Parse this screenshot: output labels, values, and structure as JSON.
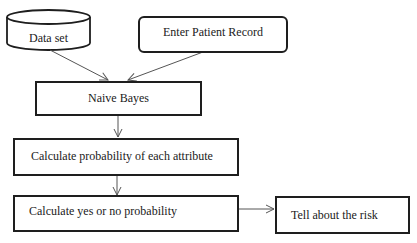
{
  "diagram": {
    "type": "flowchart",
    "nodes": {
      "dataset": {
        "label": "Data set",
        "shape": "cylinder"
      },
      "patient": {
        "label": "Enter Patient Record",
        "shape": "rounded-rect"
      },
      "naive": {
        "label": "Naive Bayes",
        "shape": "rect"
      },
      "attr": {
        "label": "Calculate probability of each attribute",
        "shape": "rect"
      },
      "yesno": {
        "label": "Calculate yes or no probability",
        "shape": "rect"
      },
      "risk": {
        "label": "Tell about the risk",
        "shape": "rect"
      }
    },
    "edges": [
      {
        "from": "Data set",
        "to": "Naive Bayes"
      },
      {
        "from": "Enter Patient Record",
        "to": "Naive Bayes"
      },
      {
        "from": "Naive Bayes",
        "to": "Calculate probability of each attribute"
      },
      {
        "from": "Calculate probability of each attribute",
        "to": "Calculate yes or no probability"
      },
      {
        "from": "Calculate yes or no probability",
        "to": "Tell about the risk"
      }
    ],
    "colors": {
      "stroke": "#1e1e1e",
      "arrow": "#555555",
      "background": "#ffffff"
    }
  }
}
